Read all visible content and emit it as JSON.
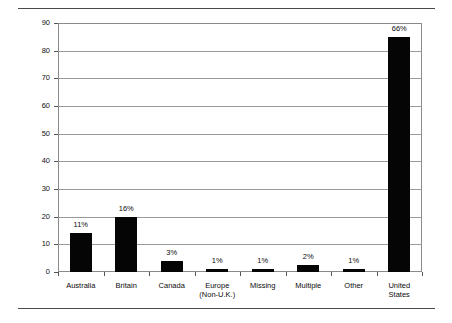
{
  "chart_data": {
    "type": "bar",
    "title": "",
    "subtitle": "",
    "xlabel": "",
    "ylabel": "",
    "ylim": [
      0,
      90
    ],
    "ytick_step": 10,
    "grid": true,
    "legend": "none",
    "bar_color": "#050505",
    "axis_color": "#8a8a8a",
    "grid_color": "#9a9a9a",
    "categories": [
      "Australia",
      "Britain",
      "Canada",
      "Europe\n(Non-U.K.)",
      "Missing",
      "Multiple",
      "Other",
      "United\nStates"
    ],
    "values": [
      14,
      20,
      4,
      1.2,
      1.2,
      2.5,
      1.2,
      85
    ],
    "data_labels": [
      "11%",
      "16%",
      "3%",
      "1%",
      "1%",
      "2%",
      "1%",
      "66%"
    ],
    "ytick_labels": [
      "0",
      "10",
      "20",
      "30",
      "40",
      "50",
      "60",
      "70",
      "80",
      "90"
    ]
  }
}
